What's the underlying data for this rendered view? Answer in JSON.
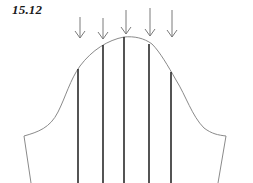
{
  "figure": {
    "label": "15.12",
    "colors": {
      "outline": "#8a8a8a",
      "slash_lines": "#2a2a2a",
      "arrows": "#7a7a7a",
      "background": "#ffffff"
    },
    "arrows": [
      {
        "x": 80,
        "y1": 17,
        "y2": 38
      },
      {
        "x": 103,
        "y1": 18,
        "y2": 39
      },
      {
        "x": 126,
        "y1": 10,
        "y2": 34
      },
      {
        "x": 150,
        "y1": 8,
        "y2": 36
      },
      {
        "x": 172,
        "y1": 10,
        "y2": 37
      }
    ],
    "slash_lines": [
      {
        "x": 78,
        "y_top": 69
      },
      {
        "x": 103,
        "y_top": 45
      },
      {
        "x": 124,
        "y_top": 37
      },
      {
        "x": 149,
        "y_top": 44
      },
      {
        "x": 171,
        "y_top": 72
      }
    ]
  }
}
